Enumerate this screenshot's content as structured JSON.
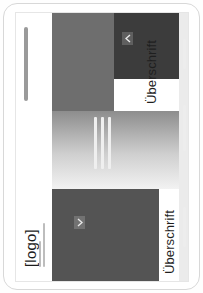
{
  "frame": {
    "name": "tablet-device-frame",
    "border_color": "#d8d8d8",
    "background": "#ffffff"
  },
  "page": {
    "orientation": "rotated-90-ccw",
    "background": "#ffffff",
    "header": {
      "logo_label": "[logo]",
      "meta_line_1": "",
      "meta_line_2": "",
      "nav_bar_label": ""
    },
    "sections": [
      {
        "id": "section-1",
        "heading": "Überschrift",
        "chevron_icon": "chevron-up-icon",
        "block_color": "#3c3c3c"
      },
      {
        "id": "section-2",
        "heading": "Überschrift",
        "chevron_icon": "chevron-down-icon",
        "block_color": "#545454"
      }
    ],
    "blocks": [
      {
        "name": "hero-block-dark",
        "color": "#3c3c3c"
      },
      {
        "name": "hero-block-mid",
        "color": "#6e6e6e"
      },
      {
        "name": "feature-gradient",
        "color": "#cfcfcf"
      },
      {
        "name": "content-block-gray",
        "color": "#545454"
      }
    ],
    "rules": [
      "",
      "",
      ""
    ],
    "placeholder_lines": [
      "",
      "",
      ""
    ]
  },
  "colors": {
    "dark": "#3c3c3c",
    "mid": "#6e6e6e",
    "gray": "#545454",
    "light": "#ebebeb",
    "text": "#1f1f1f",
    "frame_border": "#d8d8d8"
  }
}
